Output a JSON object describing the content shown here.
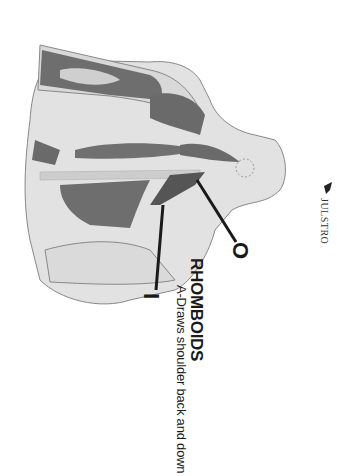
{
  "figure": {
    "muscle_name": "RHOMBOIDS",
    "action": "A-Draws shoulder back and down",
    "origin_label": "O",
    "insertion_label": "I",
    "publisher_logo": "JULSTRO",
    "orientation": "rotated 90 degrees clockwise",
    "colors": {
      "background": "#ffffff",
      "skin": "#dcdcdc",
      "muscle": "#6e6e6e",
      "highlight_muscle": "#555555",
      "leader_line": "#1a1a1a"
    }
  }
}
